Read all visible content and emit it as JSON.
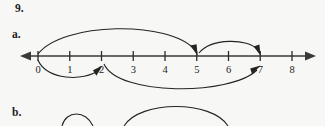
{
  "worksheet": {
    "problem_number": "9.",
    "part_a_label": "a.",
    "part_b_label": "b."
  },
  "chart_data": {
    "type": "number-line",
    "title": "",
    "xlabel": "",
    "ylabel": "",
    "grid": false,
    "legend": false,
    "axis": {
      "min": 0,
      "max": 8,
      "tick_labels": [
        "0",
        "1",
        "2",
        "3",
        "4",
        "5",
        "6",
        "7",
        "8"
      ],
      "tick_values": [
        0,
        1,
        2,
        3,
        4,
        5,
        6,
        7,
        8
      ],
      "left_arrow": true,
      "right_arrow": true
    },
    "jumps": [
      {
        "from": 0,
        "to": 5,
        "side": "above",
        "size": 5,
        "arrowhead": "at-end"
      },
      {
        "from": 5,
        "to": 7,
        "side": "above",
        "size": 2,
        "arrowhead": "at-end"
      },
      {
        "from": 0,
        "to": 2,
        "side": "below",
        "size": 2,
        "arrowhead": "at-end"
      },
      {
        "from": 2,
        "to": 7,
        "side": "below",
        "size": 5,
        "arrowhead": "at-end"
      }
    ],
    "part_b_partial_arcs": [
      {
        "side": "above",
        "clipped": true
      },
      {
        "side": "above",
        "clipped": true
      }
    ]
  },
  "colors": {
    "page_background": "#f7f7f5",
    "ink": "#1d1d1d",
    "axis": "#3a3a3a",
    "arc": "#242424"
  }
}
